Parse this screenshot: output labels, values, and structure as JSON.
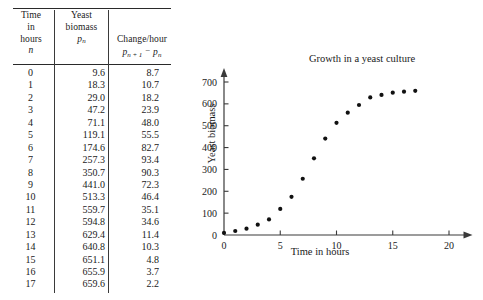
{
  "figure": {
    "table": {
      "headers": [
        {
          "lines": [
            "Time",
            "in",
            "hours"
          ],
          "symbol": "n"
        },
        {
          "lines": [
            "Yeast",
            "biomass"
          ],
          "symbol": "p_n"
        },
        {
          "lines": [
            "Change/hour"
          ],
          "symbol": "p_{n+1} - p_n"
        }
      ],
      "header_plain": [
        "Time in hours n",
        "Yeast biomass p_n",
        "Change/hour p_n+1 - p_n"
      ],
      "rows": [
        {
          "n": "0",
          "biomass": "9.6",
          "change": "8.7"
        },
        {
          "n": "1",
          "biomass": "18.3",
          "change": "10.7"
        },
        {
          "n": "2",
          "biomass": "29.0",
          "change": "18.2"
        },
        {
          "n": "3",
          "biomass": "47.2",
          "change": "23.9"
        },
        {
          "n": "4",
          "biomass": "71.1",
          "change": "48.0"
        },
        {
          "n": "5",
          "biomass": "119.1",
          "change": "55.5"
        },
        {
          "n": "6",
          "biomass": "174.6",
          "change": "82.7"
        },
        {
          "n": "7",
          "biomass": "257.3",
          "change": "93.4"
        },
        {
          "n": "8",
          "biomass": "350.7",
          "change": "90.3"
        },
        {
          "n": "9",
          "biomass": "441.0",
          "change": "72.3"
        },
        {
          "n": "10",
          "biomass": "513.3",
          "change": "46.4"
        },
        {
          "n": "11",
          "biomass": "559.7",
          "change": "35.1"
        },
        {
          "n": "12",
          "biomass": "594.8",
          "change": "34.6"
        },
        {
          "n": "13",
          "biomass": "629.4",
          "change": "11.4"
        },
        {
          "n": "14",
          "biomass": "640.8",
          "change": "10.3"
        },
        {
          "n": "15",
          "biomass": "651.1",
          "change": "4.8"
        },
        {
          "n": "16",
          "biomass": "655.9",
          "change": "3.7"
        },
        {
          "n": "17",
          "biomass": "659.6",
          "change": "2.2"
        }
      ]
    }
  },
  "chart_data": {
    "type": "scatter",
    "title": "Growth in a yeast culture",
    "xlabel": "Time in hours",
    "ylabel": "Yeast biomass",
    "x": [
      0,
      1,
      2,
      3,
      4,
      5,
      6,
      7,
      8,
      9,
      10,
      11,
      12,
      13,
      14,
      15,
      16,
      17
    ],
    "values": [
      9.6,
      18.3,
      29.0,
      47.2,
      71.1,
      119.1,
      174.6,
      257.3,
      350.7,
      441.0,
      513.3,
      559.7,
      594.8,
      629.4,
      640.8,
      651.1,
      655.9,
      659.6
    ],
    "xlim": [
      0,
      22
    ],
    "ylim": [
      0,
      760
    ],
    "xticks": [
      0,
      5,
      10,
      15,
      20
    ],
    "xtick_labels": [
      "0",
      "5",
      "10",
      "15",
      "20"
    ],
    "yticks": [
      0,
      100,
      200,
      300,
      400,
      500,
      600,
      700
    ],
    "ytick_labels": [
      "0",
      "100",
      "200",
      "300",
      "400",
      "500",
      "600",
      "700"
    ],
    "grid": false,
    "legend": null,
    "marker": "filled-circle",
    "marker_color": "#111111",
    "axis_color": "#3a3a3a",
    "axis_arrows": [
      "x-right",
      "y-up"
    ]
  }
}
